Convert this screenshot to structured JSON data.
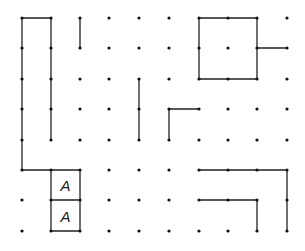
{
  "diagram": {
    "type": "dot-grid-puzzle",
    "columns": [
      22,
      51,
      80,
      109,
      139,
      169,
      199,
      228,
      257,
      287
    ],
    "rows": [
      18,
      48,
      79,
      109,
      140,
      170,
      200,
      231
    ],
    "colors": {
      "line": "#222222",
      "dot": "#111111"
    },
    "segments": [
      [
        [
          0,
          0
        ],
        [
          1,
          0
        ]
      ],
      [
        [
          0,
          0
        ],
        [
          0,
          5
        ]
      ],
      [
        [
          1,
          0
        ],
        [
          1,
          4
        ]
      ],
      [
        [
          0,
          5
        ],
        [
          2,
          5
        ]
      ],
      [
        [
          2,
          0
        ],
        [
          2,
          1
        ]
      ],
      [
        [
          4,
          2
        ],
        [
          4,
          4
        ]
      ],
      [
        [
          6,
          0
        ],
        [
          8,
          0
        ]
      ],
      [
        [
          8,
          0
        ],
        [
          8,
          2
        ]
      ],
      [
        [
          8,
          2
        ],
        [
          6,
          2
        ]
      ],
      [
        [
          6,
          2
        ],
        [
          6,
          0
        ]
      ],
      [
        [
          8,
          1
        ],
        [
          9,
          1
        ]
      ],
      [
        [
          5,
          3
        ],
        [
          6,
          3
        ]
      ],
      [
        [
          5,
          3
        ],
        [
          5,
          4
        ]
      ],
      [
        [
          1,
          5
        ],
        [
          1,
          7
        ]
      ],
      [
        [
          2,
          5
        ],
        [
          2,
          7
        ]
      ],
      [
        [
          1,
          6
        ],
        [
          2,
          6
        ]
      ],
      [
        [
          1,
          7
        ],
        [
          2,
          7
        ]
      ],
      [
        [
          6,
          5
        ],
        [
          9,
          5
        ]
      ],
      [
        [
          9,
          5
        ],
        [
          9,
          7
        ]
      ],
      [
        [
          6,
          6
        ],
        [
          8,
          6
        ]
      ],
      [
        [
          8,
          6
        ],
        [
          8,
          7
        ]
      ]
    ],
    "labels": [
      {
        "text": "A",
        "col": 1.5,
        "row": 5.5
      },
      {
        "text": "A",
        "col": 1.5,
        "row": 6.5
      }
    ]
  }
}
